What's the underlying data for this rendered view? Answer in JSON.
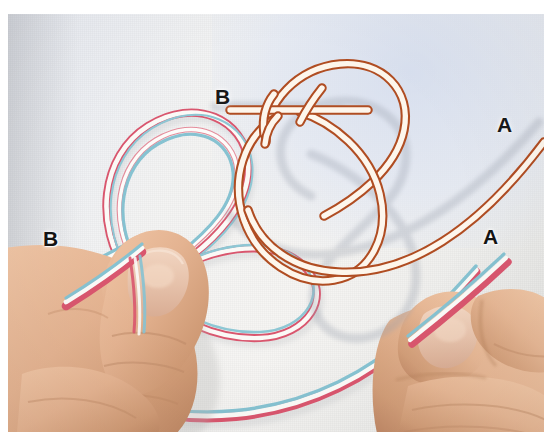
{
  "page": {
    "kind": "instructional-photo",
    "canvas": {
      "width": 552,
      "height": 443
    },
    "background_color": "#ffffff"
  },
  "photo": {
    "backdrop_color": "#f3f3f2",
    "backdrop_tint_color": "#dde3ef",
    "description": "Two hands holding a flat braided cord formed into two loops, photographed on a pale textured cloth background"
  },
  "diagram": {
    "name": "knot-schematic",
    "line_color": "#b04d22",
    "fill_color": "#fdf6ec",
    "shadow_color": "#c9c9cf"
  },
  "cord": {
    "edge_color_warm": "#e0647a",
    "edge_color_cool": "#7fc0ce",
    "core_color": "#fbfbf9",
    "description": "Flat braided band, pink-red on one edge, light teal on the other, white centre"
  },
  "skin": {
    "base": "#e8b896",
    "mid": "#d9a17c",
    "shadow": "#b77f5d",
    "nail": "#e7c4ad"
  },
  "labels": [
    {
      "id": "diagram-b",
      "text": "B",
      "x": 215,
      "y": 82,
      "style": "dark",
      "note": "end B on the knot schematic"
    },
    {
      "id": "diagram-a",
      "text": "A",
      "x": 497,
      "y": 110,
      "style": "dark",
      "note": "end A on the knot schematic"
    },
    {
      "id": "photo-b",
      "text": "B",
      "x": 43,
      "y": 224,
      "style": "onskin",
      "note": "end B of the real cord at left hand"
    },
    {
      "id": "photo-a",
      "text": "A",
      "x": 483,
      "y": 222,
      "style": "onskin",
      "note": "end A of the real cord at right hand"
    }
  ]
}
